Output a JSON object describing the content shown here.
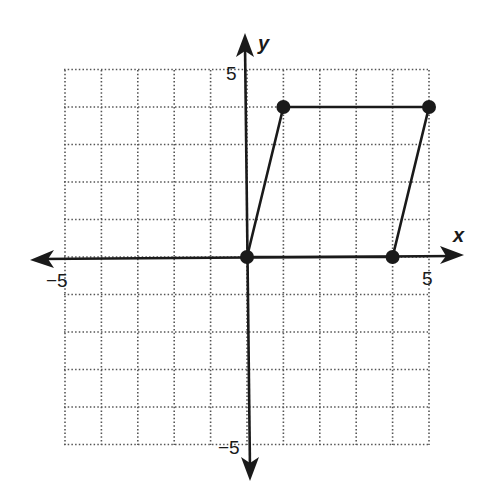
{
  "diagram": {
    "type": "coordinate-plane",
    "x_axis": {
      "label": "x",
      "min": -5,
      "max": 5,
      "tick_labels": [
        "-5",
        "5"
      ]
    },
    "y_axis": {
      "label": "y",
      "min": -5,
      "max": 5,
      "tick_labels": [
        "5",
        "-5"
      ]
    },
    "grid": {
      "style": "dotted",
      "step": 1
    },
    "shape": {
      "name": "parallelogram",
      "vertices": [
        [
          0,
          0
        ],
        [
          1,
          4
        ],
        [
          5,
          4
        ],
        [
          4,
          0
        ]
      ]
    },
    "colors": {
      "ink": "#1a1a1a",
      "grid": "#555555",
      "background": "#ffffff"
    }
  },
  "labels": {
    "x_axis": "x",
    "y_axis": "y",
    "x_min": "−5",
    "x_max": "5",
    "y_max": "5",
    "y_min": "−5"
  }
}
